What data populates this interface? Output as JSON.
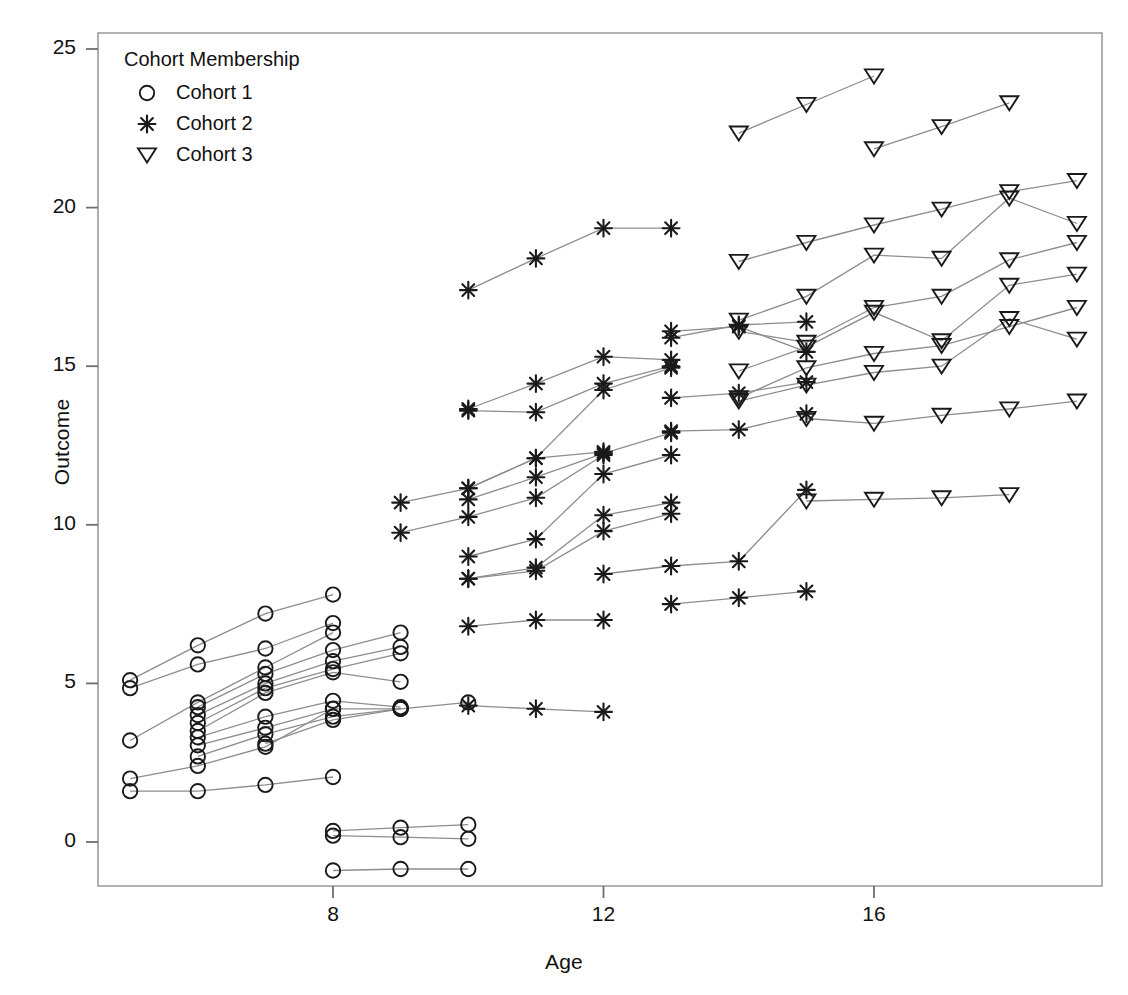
{
  "chart_data": {
    "type": "line",
    "title": "",
    "xlabel": "Age",
    "ylabel": "Outcome",
    "xlim": [
      4.2,
      19.6
    ],
    "ylim": [
      -1.9,
      25.9
    ],
    "xticks": [
      8,
      12,
      16
    ],
    "yticks": [
      0,
      5,
      10,
      15,
      20,
      25
    ],
    "grid": false,
    "legend": {
      "position": "top-left",
      "title": "Cohort Membership",
      "entries": [
        {
          "label": "Cohort 1",
          "marker": "open-circle"
        },
        {
          "label": "Cohort 2",
          "marker": "asterisk"
        },
        {
          "label": "Cohort 3",
          "marker": "open-down-triangle"
        }
      ]
    },
    "series": [
      {
        "name": "Cohort 1",
        "marker": "open-circle",
        "x": [
          5,
          6,
          7,
          8
        ],
        "values": [
          5.1,
          6.2,
          7.2,
          7.8
        ]
      },
      {
        "name": "Cohort 1",
        "marker": "open-circle",
        "x": [
          5,
          6,
          7,
          8
        ],
        "values": [
          4.85,
          5.6,
          6.1,
          6.9
        ]
      },
      {
        "name": "Cohort 1",
        "marker": "open-circle",
        "x": [
          5,
          6,
          7,
          8
        ],
        "values": [
          3.2,
          4.4,
          5.5,
          6.6
        ]
      },
      {
        "name": "Cohort 1",
        "marker": "open-circle",
        "x": [
          5,
          6,
          7,
          8
        ],
        "values": [
          2.0,
          2.4,
          3.0,
          4.2
        ]
      },
      {
        "name": "Cohort 1",
        "marker": "open-circle",
        "x": [
          5,
          6,
          7,
          8
        ],
        "values": [
          1.6,
          1.6,
          1.8,
          2.05
        ]
      },
      {
        "name": "Cohort 1",
        "marker": "open-circle",
        "x": [
          6,
          7,
          8,
          9
        ],
        "values": [
          4.25,
          5.3,
          6.05,
          6.6
        ]
      },
      {
        "name": "Cohort 1",
        "marker": "open-circle",
        "x": [
          6,
          7,
          8,
          9
        ],
        "values": [
          4.0,
          5.0,
          5.7,
          6.15
        ]
      },
      {
        "name": "Cohort 1",
        "marker": "open-circle",
        "x": [
          6,
          7,
          8,
          9
        ],
        "values": [
          3.75,
          4.85,
          5.45,
          5.95
        ]
      },
      {
        "name": "Cohort 1",
        "marker": "open-circle",
        "x": [
          6,
          7,
          8,
          9
        ],
        "values": [
          3.5,
          4.7,
          5.35,
          5.05
        ]
      },
      {
        "name": "Cohort 1",
        "marker": "open-circle",
        "x": [
          6,
          7,
          8,
          9
        ],
        "values": [
          3.3,
          3.95,
          4.45,
          4.25
        ]
      },
      {
        "name": "Cohort 1",
        "marker": "open-circle",
        "x": [
          6,
          7,
          8,
          9
        ],
        "values": [
          3.05,
          3.6,
          4.2,
          4.2
        ]
      },
      {
        "name": "Cohort 1",
        "marker": "open-circle",
        "x": [
          6,
          7,
          8,
          9
        ],
        "values": [
          2.7,
          3.4,
          3.95,
          4.2
        ]
      },
      {
        "name": "Cohort 1",
        "marker": "open-circle",
        "x": [
          7,
          8,
          9,
          10
        ],
        "values": [
          3.1,
          3.85,
          4.2,
          4.4
        ]
      },
      {
        "name": "Cohort 1",
        "marker": "open-circle",
        "x": [
          8,
          9,
          10
        ],
        "values": [
          0.35,
          0.45,
          0.55
        ]
      },
      {
        "name": "Cohort 1",
        "marker": "open-circle",
        "x": [
          8,
          9,
          10
        ],
        "values": [
          0.2,
          0.15,
          0.1
        ]
      },
      {
        "name": "Cohort 1",
        "marker": "open-circle",
        "x": [
          8,
          9,
          10
        ],
        "values": [
          -0.9,
          -0.85,
          -0.85
        ]
      },
      {
        "name": "Cohort 2",
        "marker": "asterisk",
        "x": [
          10,
          11,
          12,
          13
        ],
        "values": [
          17.4,
          18.4,
          19.35,
          19.35
        ]
      },
      {
        "name": "Cohort 2",
        "marker": "asterisk",
        "x": [
          10,
          11,
          12,
          13
        ],
        "values": [
          13.65,
          14.45,
          15.3,
          15.2
        ]
      },
      {
        "name": "Cohort 2",
        "marker": "asterisk",
        "x": [
          10,
          11,
          12,
          13
        ],
        "values": [
          13.6,
          13.55,
          14.45,
          15.0
        ]
      },
      {
        "name": "Cohort 2",
        "marker": "asterisk",
        "x": [
          9,
          10,
          11,
          12
        ],
        "values": [
          10.7,
          11.15,
          12.1,
          12.3
        ]
      },
      {
        "name": "Cohort 2",
        "marker": "asterisk",
        "x": [
          9,
          10,
          11,
          12
        ],
        "values": [
          9.75,
          10.25,
          10.85,
          12.2
        ]
      },
      {
        "name": "Cohort 2",
        "marker": "asterisk",
        "x": [
          10,
          11,
          12,
          13
        ],
        "values": [
          11.15,
          12.1,
          14.25,
          14.95
        ]
      },
      {
        "name": "Cohort 2",
        "marker": "asterisk",
        "x": [
          10,
          11,
          12,
          13
        ],
        "values": [
          10.8,
          11.5,
          12.25,
          12.9
        ]
      },
      {
        "name": "Cohort 2",
        "marker": "asterisk",
        "x": [
          10,
          11,
          12,
          13
        ],
        "values": [
          9.0,
          9.55,
          11.6,
          12.2
        ]
      },
      {
        "name": "Cohort 2",
        "marker": "asterisk",
        "x": [
          10,
          11,
          12,
          13
        ],
        "values": [
          8.3,
          8.65,
          10.3,
          10.7
        ]
      },
      {
        "name": "Cohort 2",
        "marker": "asterisk",
        "x": [
          10,
          11,
          12,
          13
        ],
        "values": [
          8.3,
          8.55,
          9.8,
          10.35
        ]
      },
      {
        "name": "Cohort 2",
        "marker": "asterisk",
        "x": [
          12,
          13,
          14,
          15
        ],
        "values": [
          8.45,
          8.7,
          8.85,
          11.1
        ]
      },
      {
        "name": "Cohort 2",
        "marker": "asterisk",
        "x": [
          13,
          14,
          15
        ],
        "values": [
          7.5,
          7.7,
          7.9
        ]
      },
      {
        "name": "Cohort 2",
        "marker": "asterisk",
        "x": [
          10,
          11,
          12
        ],
        "values": [
          6.8,
          7.0,
          7.0
        ]
      },
      {
        "name": "Cohort 2",
        "marker": "asterisk",
        "x": [
          10,
          11,
          12
        ],
        "values": [
          4.3,
          4.2,
          4.1
        ]
      },
      {
        "name": "Cohort 2",
        "marker": "asterisk",
        "x": [
          13,
          14,
          15
        ],
        "values": [
          12.95,
          13.0,
          13.5
        ]
      },
      {
        "name": "Cohort 2",
        "marker": "asterisk",
        "x": [
          13,
          14,
          15
        ],
        "values": [
          14.0,
          14.15,
          14.5
        ]
      },
      {
        "name": "Cohort 2",
        "marker": "asterisk",
        "x": [
          13,
          14,
          15
        ],
        "values": [
          15.9,
          16.3,
          16.4
        ]
      },
      {
        "name": "Cohort 2",
        "marker": "asterisk",
        "x": [
          13,
          14,
          15
        ],
        "values": [
          16.1,
          16.25,
          15.45
        ]
      },
      {
        "name": "Cohort 3",
        "marker": "open-down-triangle",
        "x": [
          14,
          15,
          16
        ],
        "values": [
          22.35,
          23.25,
          24.15
        ]
      },
      {
        "name": "Cohort 3",
        "marker": "open-down-triangle",
        "x": [
          16,
          17,
          18
        ],
        "values": [
          21.85,
          22.55,
          23.3
        ]
      },
      {
        "name": "Cohort 3",
        "marker": "open-down-triangle",
        "x": [
          14,
          15,
          16,
          17,
          18,
          19
        ],
        "values": [
          18.3,
          18.9,
          19.45,
          19.95,
          20.5,
          20.85
        ]
      },
      {
        "name": "Cohort 3",
        "marker": "open-down-triangle",
        "x": [
          14,
          15,
          16,
          17,
          18,
          19
        ],
        "values": [
          16.45,
          17.2,
          18.5,
          18.4,
          20.3,
          19.5
        ]
      },
      {
        "name": "Cohort 3",
        "marker": "open-down-triangle",
        "x": [
          14,
          15,
          16,
          17,
          18,
          19
        ],
        "values": [
          16.1,
          15.75,
          16.85,
          17.2,
          18.35,
          18.9
        ]
      },
      {
        "name": "Cohort 3",
        "marker": "open-down-triangle",
        "x": [
          14,
          15,
          16,
          17,
          18,
          19
        ],
        "values": [
          14.85,
          15.6,
          16.7,
          15.8,
          17.55,
          17.9
        ]
      },
      {
        "name": "Cohort 3",
        "marker": "open-down-triangle",
        "x": [
          14,
          15,
          16,
          17,
          18,
          19
        ],
        "values": [
          14.0,
          14.95,
          15.4,
          15.65,
          16.25,
          16.85
        ]
      },
      {
        "name": "Cohort 3",
        "marker": "open-down-triangle",
        "x": [
          14,
          15,
          16,
          17,
          18,
          19
        ],
        "values": [
          13.9,
          14.4,
          14.8,
          15.0,
          16.5,
          15.85
        ]
      },
      {
        "name": "Cohort 3",
        "marker": "open-down-triangle",
        "x": [
          15,
          16,
          17,
          18,
          19
        ],
        "values": [
          13.35,
          13.2,
          13.45,
          13.65,
          13.9
        ]
      },
      {
        "name": "Cohort 3",
        "marker": "open-down-triangle",
        "x": [
          15,
          16,
          17,
          18
        ],
        "values": [
          10.75,
          10.8,
          10.85,
          10.95
        ]
      }
    ]
  },
  "axes": {
    "x_tick_labels": [
      "8",
      "12",
      "16"
    ],
    "y_tick_labels": [
      "0",
      "5",
      "10",
      "15",
      "20",
      "25"
    ]
  },
  "style": {
    "marker_color": "#1a1a1a",
    "line_color": "#8d8d8d",
    "frame_color": "#9a9a9a",
    "background": "#ffffff"
  }
}
